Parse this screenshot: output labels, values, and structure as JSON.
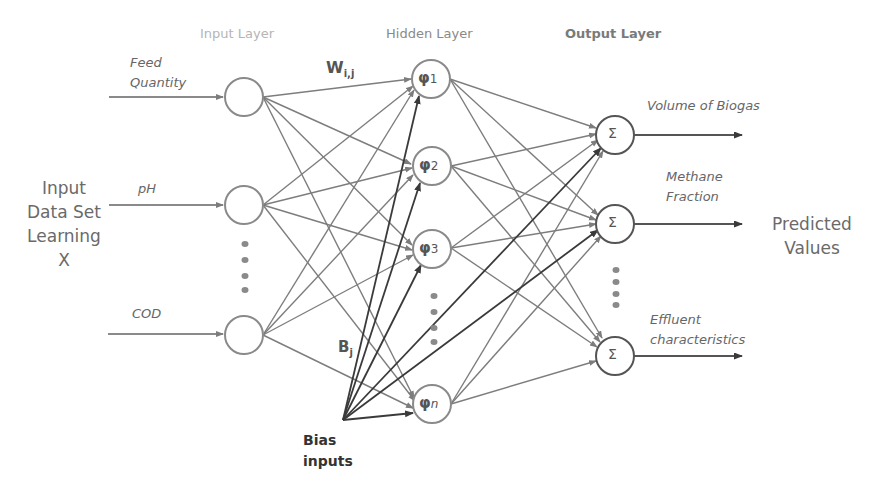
{
  "layers": {
    "input_title": "Input Layer",
    "hidden_title": "Hidden Layer",
    "output_title": "Output Layer"
  },
  "left_label": [
    "Input",
    "Data Set",
    "Learning",
    "X"
  ],
  "right_label": [
    "Predicted",
    "Values"
  ],
  "inputs": [
    {
      "label_lines": [
        "Feed",
        "Quantity"
      ]
    },
    {
      "label_lines": [
        "pH"
      ]
    },
    {
      "label_lines": [
        "COD"
      ]
    }
  ],
  "hidden_nodes": [
    {
      "symbol": "φ",
      "sub": "1"
    },
    {
      "symbol": "φ",
      "sub": "2"
    },
    {
      "symbol": "φ",
      "sub": "3"
    },
    {
      "symbol": "φ",
      "sub": "n"
    }
  ],
  "outputs": [
    {
      "symbol": "Σ",
      "label_lines": [
        "Volume of Biogas"
      ]
    },
    {
      "symbol": "Σ",
      "label_lines": [
        "Methane",
        "Fraction"
      ]
    },
    {
      "symbol": "Σ",
      "label_lines": [
        "Effluent",
        "characteristics"
      ]
    }
  ],
  "weights_label": {
    "main": "W",
    "sub": "i,j"
  },
  "bias_weight_label": {
    "main": "B",
    "sub": "j"
  },
  "bias_label": [
    "Bias",
    "inputs"
  ],
  "colors": {
    "line": "#7d7d7d",
    "bias_line": "#3a3a3a",
    "node_stroke": "#8a8a8a",
    "text": "#666666",
    "light_title": "#b5b5b5"
  }
}
